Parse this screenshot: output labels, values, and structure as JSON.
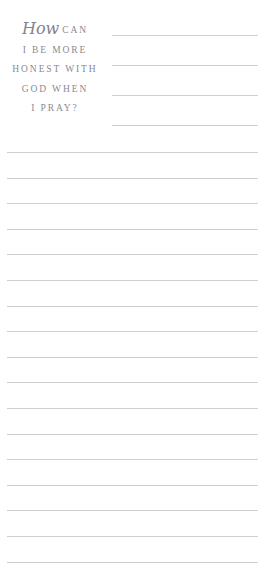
{
  "page": {
    "background_color": "#ffffff",
    "width": 267,
    "height": 575
  },
  "prompt": {
    "script_word": "How",
    "line1_rest": "CAN",
    "line2": "I BE MORE",
    "line3": "HONEST WITH",
    "line4": "GOD WHEN",
    "line5": "I PRAY?",
    "full_text": "How can I be more honest with God when I pray?",
    "text_color": "#8a8a93"
  },
  "writing_area": {
    "line_color": "#cfcfd2",
    "short_rules": {
      "count": 4,
      "left": 112,
      "width": 146,
      "tops": [
        35,
        65,
        95,
        125
      ]
    },
    "full_rules": {
      "count": 17,
      "left": 7,
      "width": 251,
      "first_top": 152,
      "spacing": 25.6
    }
  }
}
